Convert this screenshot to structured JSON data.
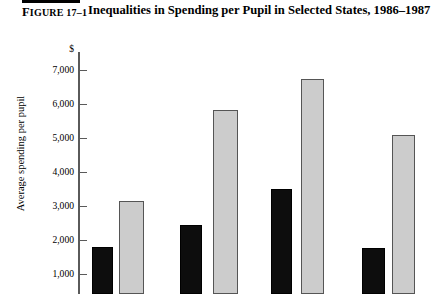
{
  "header": {
    "figure_label": "Figure",
    "figure_number": "17–1",
    "title": "Inequalities in Spending per Pupil in Selected States, 1986–1987"
  },
  "chart_data": {
    "type": "bar",
    "title": "Inequalities in Spending per Pupil in Selected States, 1986–1987",
    "xlabel": "",
    "ylabel": "Average spending per pupil",
    "currency_symbol": "$",
    "ylim": [
      0,
      7000
    ],
    "yticks": [
      7000,
      6000,
      5000,
      4000,
      3000,
      2000,
      1000
    ],
    "ytick_labels": [
      "7,000",
      "6,000",
      "5,000",
      "4,000",
      "3,000",
      "2,000",
      "1,000"
    ],
    "grid": false,
    "legend": "none",
    "categories": [
      "Group 1",
      "Group 2",
      "Group 3",
      "Group 4"
    ],
    "series": [
      {
        "name": "Lowest-spending district",
        "color": "#0d0d0d",
        "values": [
          1800,
          2400,
          3450,
          1750
        ]
      },
      {
        "name": "Highest-spending district",
        "color": "#cccccc",
        "values": [
          3150,
          5800,
          6700,
          5000
        ]
      }
    ]
  },
  "ticks": [
    {
      "label": "7,000",
      "top": 70
    },
    {
      "label": "6,000",
      "top": 104
    },
    {
      "label": "5,000",
      "top": 138
    },
    {
      "label": "4,000",
      "top": 172
    },
    {
      "label": "3,000",
      "top": 206
    },
    {
      "label": "2,000",
      "top": 240
    },
    {
      "label": "1,000",
      "top": 274
    }
  ],
  "bars": [
    {
      "name": "bar-group1-black",
      "series": "Lowest-spending district",
      "value": 1800,
      "style": "black",
      "left": 92,
      "top": 247,
      "width": 21,
      "height": 47
    },
    {
      "name": "bar-group1-gray",
      "series": "Highest-spending district",
      "value": 3150,
      "style": "gray",
      "left": 119,
      "top": 201,
      "width": 25,
      "height": 93
    },
    {
      "name": "bar-group2-black",
      "series": "Lowest-spending district",
      "value": 2400,
      "style": "black",
      "left": 180,
      "top": 225,
      "width": 22,
      "height": 69
    },
    {
      "name": "bar-group2-gray",
      "series": "Highest-spending district",
      "value": 5800,
      "style": "gray",
      "left": 213,
      "top": 110,
      "width": 25,
      "height": 184
    },
    {
      "name": "bar-group3-black",
      "series": "Lowest-spending district",
      "value": 3450,
      "style": "black",
      "left": 271,
      "top": 189,
      "width": 21,
      "height": 105
    },
    {
      "name": "bar-group3-gray",
      "series": "Highest-spending district",
      "value": 6700,
      "style": "gray",
      "left": 301,
      "top": 79,
      "width": 23,
      "height": 215
    },
    {
      "name": "bar-group4-black",
      "series": "Lowest-spending district",
      "value": 1750,
      "style": "black",
      "left": 362,
      "top": 248,
      "width": 23,
      "height": 46
    },
    {
      "name": "bar-group4-gray",
      "series": "Highest-spending district",
      "value": 5000,
      "style": "gray",
      "left": 392,
      "top": 135,
      "width": 23,
      "height": 159
    }
  ]
}
